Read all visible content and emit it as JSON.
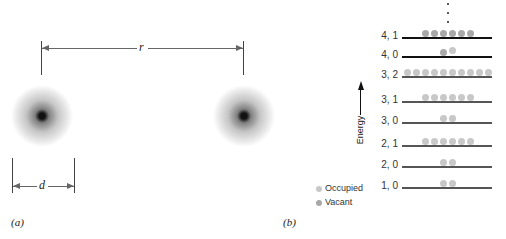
{
  "panel_a": {
    "label": "(a)",
    "separation_label": "r",
    "diameter_label": "d"
  },
  "panel_b": {
    "label": "(b)",
    "axis_label": "Energy",
    "ellipsis": "⋮",
    "colors": {
      "occupied": "#c8c8c8",
      "vacant": "#a8a8a8",
      "line": "#555555"
    },
    "levels": [
      {
        "label": "4, 1",
        "dots": 6,
        "state": "vacant"
      },
      {
        "label": "4, 0",
        "dots": 2,
        "state": "mixed"
      },
      {
        "label": "3, 2",
        "dots": 10,
        "state": "occupied"
      },
      {
        "label": "3, 1",
        "dots": 6,
        "state": "occupied"
      },
      {
        "label": "3, 0",
        "dots": 2,
        "state": "occupied"
      },
      {
        "label": "2, 1",
        "dots": 6,
        "state": "occupied"
      },
      {
        "label": "2, 0",
        "dots": 2,
        "state": "occupied"
      },
      {
        "label": "1, 0",
        "dots": 2,
        "state": "occupied"
      }
    ],
    "legend": [
      {
        "label": "Occupied",
        "color": "#c8c8c8"
      },
      {
        "label": "Vacant",
        "color": "#a8a8a8"
      }
    ]
  }
}
